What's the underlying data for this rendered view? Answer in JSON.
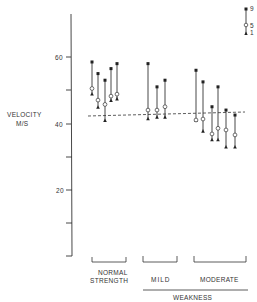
{
  "chart_data": {
    "type": "range-dot",
    "title": "",
    "ylabel": "VELOCITY M/S",
    "xlabel": "",
    "ylim": [
      0,
      70
    ],
    "yticks": [
      10,
      20,
      30,
      40,
      50,
      60
    ],
    "ytick_labels": [
      "20",
      "40",
      "60"
    ],
    "grid": false,
    "legend": {
      "position": "top-right",
      "entries": [
        {
          "marker": "filled-square",
          "label": "9"
        },
        {
          "marker": "open-circle",
          "label": "5"
        },
        {
          "marker": "filled-triangle",
          "label": "1"
        }
      ]
    },
    "reference_line": {
      "style": "dashed",
      "y_start": 42.5,
      "y_end": 43.5
    },
    "groups": [
      {
        "name": "NORMAL STRENGTH",
        "series": [
          {
            "p9": 58.5,
            "p5": 50.5,
            "p1": 49.0
          },
          {
            "p9": 55.0,
            "p5": 47.0,
            "p1": 45.0
          },
          {
            "p9": 53.0,
            "p5": 45.7,
            "p1": 41.0
          },
          {
            "p9": 56.5,
            "p5": 48.2,
            "p1": 47.0
          },
          {
            "p9": 58.0,
            "p5": 48.8,
            "p1": 47.5
          }
        ]
      },
      {
        "name": "MILD",
        "super_group": "WEAKNESS",
        "series": [
          {
            "p9": 58.0,
            "p5": 44.0,
            "p1": 41.5
          },
          {
            "p9": 51.0,
            "p5": 44.0,
            "p1": 42.0
          },
          {
            "p9": 53.0,
            "p5": 45.0,
            "p1": 42.0
          }
        ]
      },
      {
        "name": "MODERATE",
        "super_group": "WEAKNESS",
        "series": [
          {
            "p9": 56.0,
            "p5": 41.0,
            "p1": 41.0
          },
          {
            "p9": 52.5,
            "p5": 41.3,
            "p1": 37.8
          },
          {
            "p9": 45.0,
            "p5": 36.8,
            "p1": 35.2
          },
          {
            "p9": 51.0,
            "p5": 38.5,
            "p1": 35.2
          },
          {
            "p9": 44.0,
            "p5": 38.0,
            "p1": 33.0
          },
          {
            "p9": 42.5,
            "p5": 36.5,
            "p1": 33.0
          }
        ]
      }
    ],
    "category_labels": [
      "NORMAL STRENGTH",
      "MILD",
      "MODERATE"
    ],
    "super_category_label": "WEAKNESS"
  },
  "labels": {
    "y_axis_line1": "VELOCITY",
    "y_axis_line2": "M/S",
    "tick_60": "60",
    "tick_40": "40",
    "tick_20": "20",
    "legend_9": "9",
    "legend_5": "5",
    "legend_1": "1",
    "normal_line1": "NORMAL",
    "normal_line2": "STRENGTH",
    "mild": "MILD",
    "moderate": "MODERATE",
    "weakness": "WEAKNESS"
  }
}
